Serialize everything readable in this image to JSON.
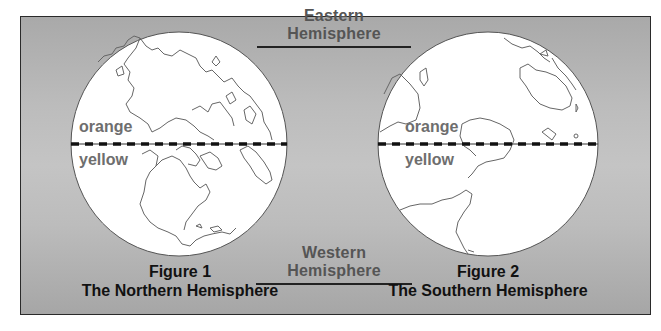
{
  "labels": {
    "eastern": "Eastern Hemisphere",
    "western": "Western Hemisphere"
  },
  "figures": [
    {
      "number": "Figure 1",
      "title": "The Northern Hemisphere",
      "upper_label": "orange",
      "lower_label": "yellow"
    },
    {
      "number": "Figure 2",
      "title": "The Southern Hemisphere",
      "upper_label": "orange",
      "lower_label": "yellow"
    }
  ],
  "colors": {
    "background_mid": "#c4c4c4",
    "background_edge": "#a8a8a8",
    "globe_fill": "#ffffff",
    "outline": "#555555",
    "label_gray": "#6e6e6e",
    "caption_text": "#111111"
  }
}
